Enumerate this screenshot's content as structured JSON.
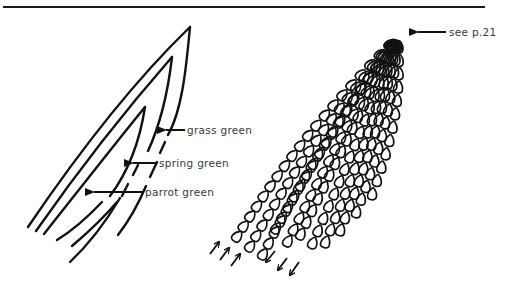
{
  "figure": {
    "left_diagram": {
      "description": "leaf outlined in parallel stitch lines",
      "labels": [
        {
          "text": "grass green",
          "x": 187,
          "y": 123
        },
        {
          "text": "spring green",
          "x": 160,
          "y": 156
        },
        {
          "text": "parrot green",
          "x": 145,
          "y": 186
        }
      ]
    },
    "right_diagram": {
      "description": "leaf filled with rows of chain stitch",
      "labels": [
        {
          "text": "see p.21",
          "x": 448,
          "y": 27
        }
      ],
      "direction_arrows": [
        {
          "group": "up",
          "count": 3
        },
        {
          "group": "down",
          "count": 3
        }
      ]
    },
    "colors": {
      "ink": "#111111",
      "label_text": "#3a3a3a",
      "background": "#ffffff"
    }
  }
}
